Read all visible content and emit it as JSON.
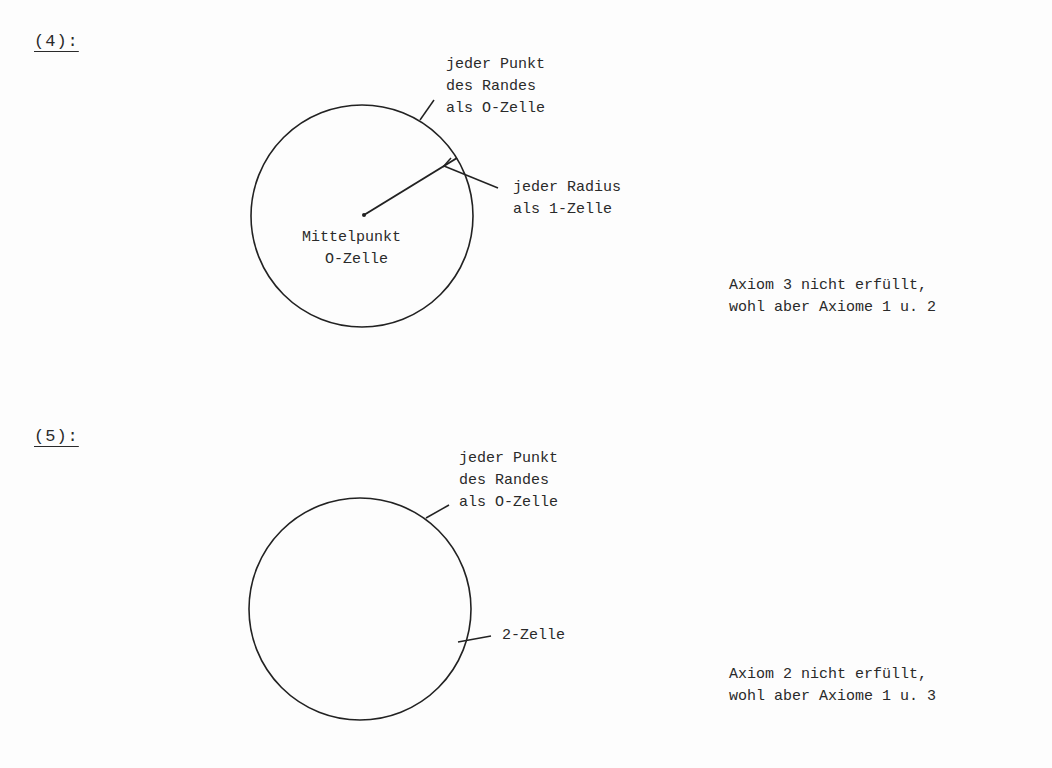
{
  "figures": [
    {
      "label": "(4):",
      "boundary_label": [
        "jeder Punkt",
        "des Randes",
        "als O-Zelle"
      ],
      "radius_label": [
        "jeder Radius",
        "als 1-Zelle"
      ],
      "center_label": [
        "Mittelpunkt",
        "O-Zelle"
      ],
      "conclusion": [
        "Axiom 3 nicht erfüllt,",
        "wohl aber Axiome 1 u. 2"
      ]
    },
    {
      "label": "(5):",
      "boundary_label": [
        "jeder Punkt",
        "des Randes",
        "als O-Zelle"
      ],
      "interior_label": "2-Zelle",
      "conclusion": [
        "Axiom 2 nicht erfüllt,",
        "wohl aber Axiome 1 u. 3"
      ]
    }
  ]
}
